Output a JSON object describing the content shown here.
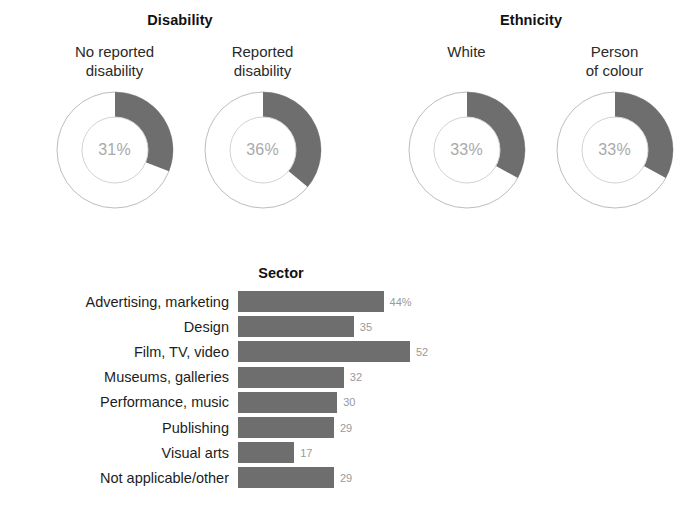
{
  "figure": {
    "background": "#ffffff",
    "bar_color": "#6e6e6e",
    "arc_color": "#6e6e6e",
    "track_color": "#ffffff",
    "value_label_color": "#9a9a9a",
    "center_text_color": "#a9a9a9"
  },
  "panels": {
    "disability": {
      "title": "Disability",
      "charts": [
        {
          "label_line1": "No reported",
          "label_line2": "disability",
          "center_label": "31%",
          "value": 31
        },
        {
          "label_line1": "Reported",
          "label_line2": "disability",
          "center_label": "36%",
          "value": 36
        }
      ]
    },
    "ethnicity": {
      "title": "Ethnicity",
      "charts": [
        {
          "label_line1": "White",
          "label_line2": "",
          "center_label": "33%",
          "value": 33
        },
        {
          "label_line1": "Person",
          "label_line2": "of colour",
          "center_label": "33%",
          "value": 33
        }
      ]
    },
    "sector": {
      "title": "Sector"
    }
  },
  "chart_data": [
    {
      "type": "pie",
      "title": "Disability",
      "subtitle": "No reported disability",
      "labels": [
        "No reported disability",
        "Remainder"
      ],
      "values": [
        31,
        69
      ],
      "center_label": "31%",
      "units": "%",
      "legend": "none"
    },
    {
      "type": "pie",
      "title": "Disability",
      "subtitle": "Reported disability",
      "labels": [
        "Reported disability",
        "Remainder"
      ],
      "values": [
        36,
        64
      ],
      "center_label": "36%",
      "units": "%",
      "legend": "none"
    },
    {
      "type": "pie",
      "title": "Ethnicity",
      "subtitle": "White",
      "labels": [
        "White",
        "Remainder"
      ],
      "values": [
        33,
        67
      ],
      "center_label": "33%",
      "units": "%",
      "legend": "none"
    },
    {
      "type": "pie",
      "title": "Ethnicity",
      "subtitle": "Person of colour",
      "labels": [
        "Person of colour",
        "Remainder"
      ],
      "values": [
        33,
        67
      ],
      "center_label": "33%",
      "units": "%",
      "legend": "none"
    },
    {
      "type": "bar",
      "orientation": "horizontal",
      "title": "Sector",
      "xlabel": "",
      "ylabel": "",
      "xlim": [
        0,
        52
      ],
      "grid": false,
      "legend": "none",
      "categories": [
        "Advertising, marketing",
        "Design",
        "Film, TV, video",
        "Museums, galleries",
        "Performance, music",
        "Publishing",
        "Visual arts",
        "Not applicable/other"
      ],
      "values": [
        44,
        35,
        52,
        32,
        30,
        29,
        17,
        29
      ],
      "value_labels": [
        "44%",
        "35",
        "52",
        "32",
        "30",
        "29",
        "17",
        "29"
      ]
    }
  ]
}
